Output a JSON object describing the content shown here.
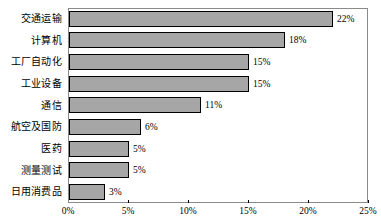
{
  "chart_data": {
    "type": "bar",
    "orientation": "horizontal",
    "title": "",
    "xlabel": "",
    "ylabel": "",
    "xlim": [
      0,
      25
    ],
    "grid": false,
    "legend": null,
    "value_suffix": "%",
    "categories": [
      "交通运输",
      "计算机",
      "工厂自动化",
      "工业设备",
      "通信",
      "航空及国防",
      "医药",
      "测量测试",
      "日用消费品"
    ],
    "values": [
      22,
      18,
      15,
      15,
      11,
      6,
      5,
      5,
      3
    ],
    "data_labels": [
      "22%",
      "18%",
      "15%",
      "15%",
      "11%",
      "6%",
      "5%",
      "5%",
      "3%"
    ],
    "xticks": [
      0,
      5,
      10,
      15,
      20,
      25
    ],
    "xtick_labels": [
      "0%",
      "5%",
      "10%",
      "15%",
      "20%",
      "25%"
    ],
    "bar_color": "#a6a6a6",
    "bar_border_color": "#000000",
    "frame_color": "#8a8a8a"
  }
}
